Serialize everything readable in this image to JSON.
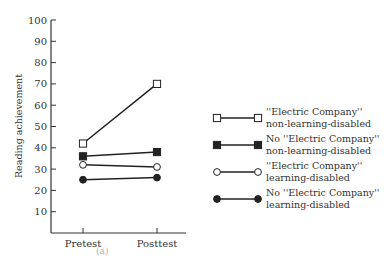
{
  "chart_data": {
    "type": "line",
    "title": "",
    "xlabel": "",
    "ylabel": "Reading achievement",
    "categories": [
      "Pretest",
      "Posttest"
    ],
    "ylim": [
      0,
      100
    ],
    "yticks": [
      10,
      20,
      30,
      40,
      50,
      60,
      70,
      80,
      90,
      100
    ],
    "grid": false,
    "legend_position": "right",
    "series": [
      {
        "name": "\"Electric Company\" non-learning-disabled",
        "line1": "''Electric Company''",
        "line2": "non-learning-disabled",
        "marker": "open-square",
        "values": [
          42,
          70
        ]
      },
      {
        "name": "No \"Electric Company\" non-learning-disabled",
        "line1": "No ''Electric Company''",
        "line2": "non-learning-disabled",
        "marker": "filled-square",
        "values": [
          36,
          38
        ]
      },
      {
        "name": "\"Electric Company\" learning-disabled",
        "line1": "''Electric Company''",
        "line2": "learning-disabled",
        "marker": "open-circle",
        "values": [
          32,
          31
        ]
      },
      {
        "name": "No \"Electric Company\" learning-disabled",
        "line1": "No ''Electric Company''",
        "line2": "learning-disabled",
        "marker": "filled-circle",
        "values": [
          25,
          26
        ]
      }
    ]
  },
  "colors": {
    "line": "#222222",
    "axis": "#333333",
    "text": "#333333"
  },
  "caption_fragment": "(a)"
}
